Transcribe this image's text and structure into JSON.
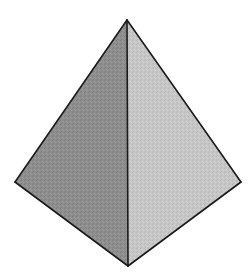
{
  "figure": {
    "background": "#ffffff",
    "stroke_color": "#1a1a1a",
    "stroke_width": 1.6,
    "vertices": {
      "top": [
        127,
        20
      ],
      "left": [
        15,
        182
      ],
      "right": [
        241,
        182
      ],
      "bottom": [
        128,
        266
      ]
    },
    "faces": [
      {
        "name": "left-face",
        "color": "#8e8e8e",
        "points": "127,20 15,182 128,266"
      },
      {
        "name": "right-face",
        "color": "#c6c6c6",
        "points": "127,20 241,182 128,266"
      }
    ],
    "edges": [
      {
        "name": "edge-top-left",
        "points": [
          127,
          20,
          15,
          182
        ]
      },
      {
        "name": "edge-top-right",
        "points": [
          127,
          20,
          241,
          182
        ]
      },
      {
        "name": "edge-left-bottom",
        "points": [
          15,
          182,
          128,
          266
        ]
      },
      {
        "name": "edge-right-bottom",
        "points": [
          241,
          182,
          128,
          266
        ]
      },
      {
        "name": "edge-center",
        "points": [
          127,
          20,
          128,
          266
        ]
      }
    ]
  }
}
